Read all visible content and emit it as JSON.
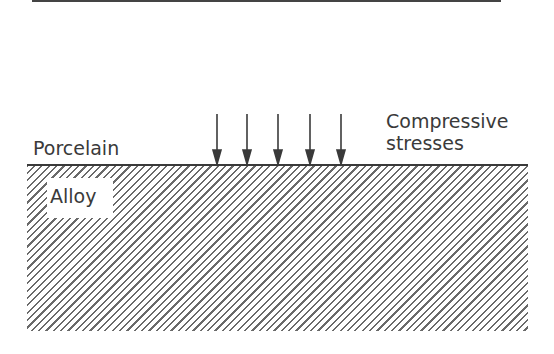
{
  "diagram": {
    "labels": {
      "porcelain": "Porcelain",
      "alloy": "Alloy",
      "stress_line1": "Compressive",
      "stress_line2": "stresses"
    },
    "arrows": {
      "count": 5,
      "direction": "down",
      "x_positions": [
        217,
        247,
        278,
        310,
        341
      ],
      "meaning": "compressive stresses on porcelain-alloy interface"
    },
    "colors": {
      "line": "#3a3a3a",
      "hatch": "#6a6a6a",
      "background": "#ffffff"
    }
  }
}
